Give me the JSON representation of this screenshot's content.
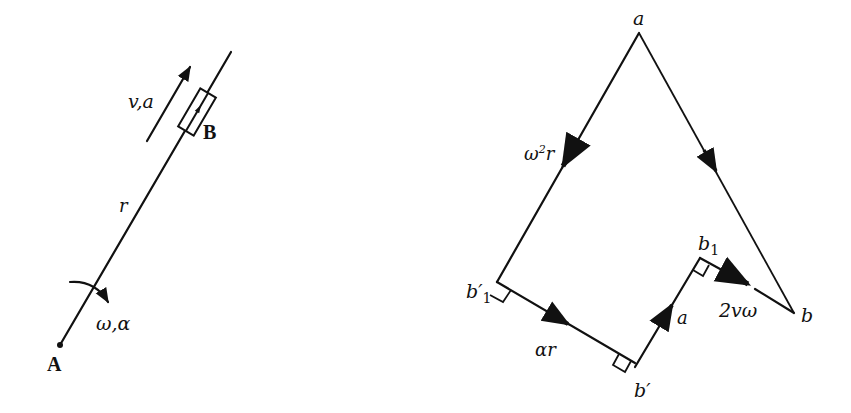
{
  "left_figure": {
    "name": "slider-on-rotating-link",
    "points": {
      "A": {
        "label": "A",
        "x": 60,
        "y": 345
      },
      "B": {
        "label": "B"
      }
    },
    "labels": {
      "velocity_accel": "v,a",
      "radius": "r",
      "angular": "ω,α",
      "point_A": "A",
      "point_B": "B"
    }
  },
  "right_figure": {
    "name": "acceleration-polygon",
    "labels": {
      "pole_a": "a",
      "point_b": "b",
      "point_b1_prime": "b′",
      "point_b1_prime_sub": "1",
      "point_b_prime": "b′",
      "point_b1": "b",
      "point_b1_sub": "1",
      "centripetal": "ω²r",
      "centripetal_base": "ω",
      "centripetal_sup": "2",
      "centripetal_r": "r",
      "tangential": "αr",
      "relative": "a",
      "coriolis": "2vω"
    },
    "vectors": [
      {
        "from": "a",
        "to": "b'1",
        "label": "ω²r"
      },
      {
        "from": "b'1",
        "to": "b'",
        "label": "αr"
      },
      {
        "from": "b'",
        "to": "b1",
        "label": "a"
      },
      {
        "from": "b1",
        "to": "b",
        "label": "2vω"
      },
      {
        "from": "a",
        "to": "b",
        "label": ""
      }
    ]
  }
}
